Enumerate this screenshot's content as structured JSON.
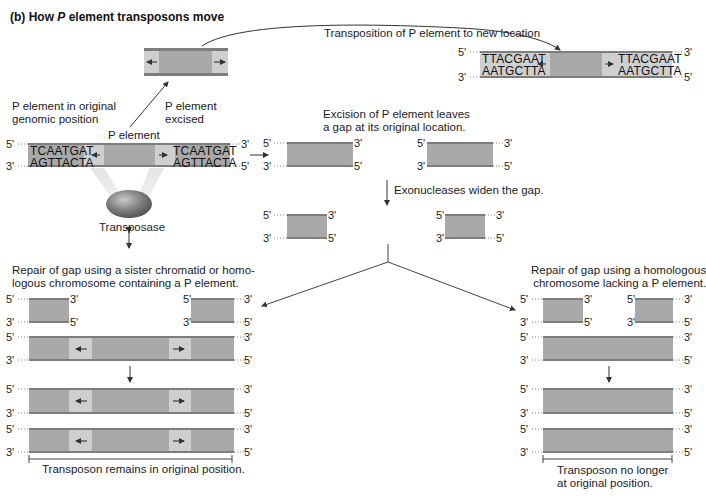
{
  "title": {
    "prefix": "(b)  How ",
    "italic": "P",
    "suffix": " element transposons move"
  },
  "labels": {
    "transposition": "Transposition of P element to new location",
    "original_position_line1": "P element in original",
    "original_position_line2": "genomic position",
    "excised_line1": "P element",
    "excised_line2": "excised",
    "p_element": "P element",
    "transposase": "Transposase",
    "excision_line1": "Excision of P element leaves",
    "excision_line2": "a gap at its original location.",
    "exonucleases": "Exonucleases widen the gap.",
    "repair_left_line1": "Repair of gap using a sister chromatid or homo-",
    "repair_left_line2": "logous chromosome containing a P element.",
    "repair_right_line1": "Repair of gap using a homologous",
    "repair_right_line2": "chromosome lacking a P element.",
    "result_left": "Transposon remains in original position.",
    "result_right_line1": "Transposon no longer",
    "result_right_line2": "at original position."
  },
  "sequences": {
    "original_top": "TCAATGAT",
    "original_bottom": "AGTTACTA",
    "new_top": "TTACGAAT",
    "new_bottom": "AATGCTTA"
  },
  "strand_ends": {
    "five": "5'",
    "three": "3'"
  },
  "colors": {
    "dna_fill": "#a9a9a9",
    "dna_edge": "#7d7d7d",
    "inverted_repeat": "#cfcfcf",
    "transposase": "#8a8a8a",
    "line": "#444444"
  }
}
